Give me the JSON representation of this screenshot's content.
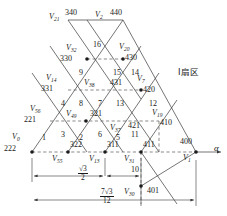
{
  "sector_label": "I扇区",
  "axis": {
    "alpha": "α"
  },
  "dimensions": [
    {
      "name": "half-root3",
      "num": "√3",
      "den": "2"
    },
    {
      "name": "seven-root3-over-12",
      "num": "7√3",
      "den": "12"
    }
  ],
  "vertices": [
    {
      "id": "V0",
      "name": "V",
      "sub": "0",
      "code": "222",
      "x": 32,
      "y": 152,
      "nx": 12,
      "ny": 133,
      "cx": 6,
      "cy": 145
    },
    {
      "id": "V55",
      "name": "V",
      "sub": "55",
      "code": "322",
      "x": 68,
      "y": 152,
      "nx": 52,
      "ny": 155,
      "cx": 70,
      "cy": 142
    },
    {
      "id": "V13",
      "name": "V",
      "sub": "13",
      "code": "311",
      "x": 105,
      "y": 152,
      "nx": 89,
      "ny": 155,
      "cx": 107,
      "cy": 142
    },
    {
      "id": "V31",
      "name": "V",
      "sub": "31",
      "code": "411",
      "x": 141,
      "y": 152,
      "nx": 124,
      "ny": 155,
      "cx": 143,
      "cy": 142
    },
    {
      "id": "V1",
      "name": "V",
      "sub": "1",
      "code": "400",
      "x": 196,
      "y": 152,
      "nx": 182,
      "ny": 154,
      "cx": 183,
      "cy": 140
    },
    {
      "id": "V56",
      "name": "V",
      "sub": "56",
      "code": "221",
      "x": 50,
      "y": 121,
      "nx": 32,
      "ny": 105,
      "cx": 27,
      "cy": 118
    },
    {
      "id": "V49",
      "name": "V",
      "sub": "49",
      "code": "321",
      "x": 86,
      "y": 121,
      "nx": 67,
      "ny": 110,
      "cx": 90,
      "cy": 110
    },
    {
      "id": "V37",
      "name": "V",
      "sub": "37",
      "code": "421",
      "x": 123,
      "y": 121,
      "nx": 111,
      "ny": 125,
      "cx": 126,
      "cy": 123
    },
    {
      "id": "V19",
      "name": "V",
      "sub": "19",
      "code": "410",
      "x": 159,
      "y": 121,
      "nx": 152,
      "ny": 110,
      "cx": 160,
      "cy": 120
    },
    {
      "id": "V14",
      "name": "V",
      "sub": "14",
      "code": "331",
      "x": 68,
      "y": 90,
      "nx": 48,
      "ny": 75,
      "cx": 44,
      "cy": 87
    },
    {
      "id": "V38",
      "name": "V",
      "sub": "38",
      "code": "431",
      "x": 105,
      "y": 90,
      "nx": 85,
      "ny": 79,
      "cx": 110,
      "cy": 80
    },
    {
      "id": "V7",
      "name": "V",
      "sub": "7",
      "code": "420",
      "x": 141,
      "y": 90,
      "nx": 137,
      "ny": 76,
      "cx": 143,
      "cy": 87
    },
    {
      "id": "V32",
      "name": "V",
      "sub": "32",
      "code": "330",
      "x": 87,
      "y": 59,
      "nx": 68,
      "ny": 45,
      "cx": 63,
      "cy": 57
    },
    {
      "id": "V20",
      "name": "V",
      "sub": "20",
      "code": "430",
      "x": 123,
      "y": 59,
      "nx": 119,
      "ny": 44,
      "cx": 125,
      "cy": 56
    },
    {
      "id": "V21",
      "name": "V",
      "sub": "21",
      "code": "340",
      "x": 68,
      "y": 20,
      "nx": 49,
      "ny": 12,
      "cx": 66,
      "cy": 10
    },
    {
      "id": "V2",
      "name": "V",
      "sub": "2",
      "code": "440",
      "x": 123,
      "y": 20,
      "nx": 95,
      "ny": 11,
      "cx": 112,
      "cy": 10
    },
    {
      "id": "V30",
      "name": "V",
      "sub": "30",
      "code": "401",
      "x": 141,
      "y": 186,
      "nx": 127,
      "ny": 188,
      "cx": 148,
      "cy": 188
    }
  ],
  "triangles": [
    {
      "num": "1",
      "x": 42,
      "y": 138
    },
    {
      "num": "2",
      "x": 79,
      "y": 138
    },
    {
      "num": "3",
      "x": 61,
      "y": 135
    },
    {
      "num": "4",
      "x": 61,
      "y": 104
    },
    {
      "num": "5",
      "x": 116,
      "y": 138
    },
    {
      "num": "6",
      "x": 98,
      "y": 135
    },
    {
      "num": "7",
      "x": 98,
      "y": 104
    },
    {
      "num": "8",
      "x": 79,
      "y": 104
    },
    {
      "num": "9",
      "x": 79,
      "y": 73
    },
    {
      "num": "10",
      "x": 134,
      "y": 170
    },
    {
      "num": "11",
      "x": 134,
      "y": 135
    },
    {
      "num": "12",
      "x": 152,
      "y": 104
    },
    {
      "num": "13",
      "x": 116,
      "y": 104
    },
    {
      "num": "14",
      "x": 134,
      "y": 73
    },
    {
      "num": "15",
      "x": 116,
      "y": 73
    },
    {
      "num": "16",
      "x": 96,
      "y": 45
    }
  ],
  "colors": {
    "line": "#3a3a3a",
    "text": "#1a1a1a"
  }
}
